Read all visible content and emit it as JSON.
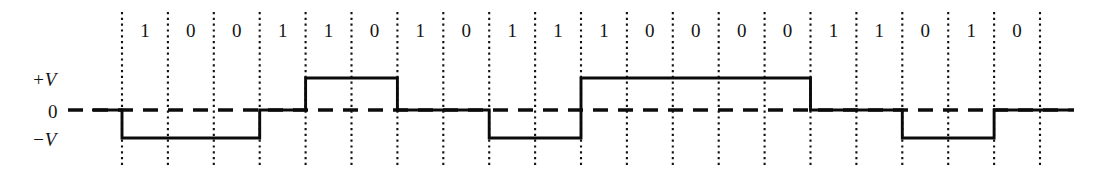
{
  "figure": {
    "title": "",
    "axis_labels": {
      "plus_v": "+V",
      "zero": "0",
      "minus_v": "−V"
    }
  },
  "chart_data": {
    "type": "line",
    "title": "",
    "xlabel": "",
    "ylabel": "",
    "subtitle": "",
    "grid": true,
    "legend": null,
    "ylim": [
      -1,
      1
    ],
    "ytick_labels": [
      "+V",
      "0",
      "−V"
    ],
    "ytick_values": [
      1,
      0,
      -1
    ],
    "bit_count": 20,
    "categories": [
      "1",
      "0",
      "0",
      "1",
      "1",
      "0",
      "1",
      "0",
      "1",
      "1",
      "1",
      "0",
      "0",
      "0",
      "0",
      "1",
      "1",
      "0",
      "1",
      "0"
    ],
    "bit_sequence": "10011010111000011010",
    "series": [
      {
        "name": "line-code-signal",
        "note": "Signal level per bit cell: 1 = +V, 0 = 0 level, -1 = −V",
        "values": [
          -1,
          -1,
          -1,
          0,
          1,
          1,
          0,
          0,
          -1,
          -1,
          1,
          1,
          1,
          1,
          1,
          0,
          0,
          -1,
          -1,
          0
        ]
      }
    ],
    "lead_in_level": 0,
    "lead_out_level": 0,
    "x_start_px": 122,
    "x_end_px": 1040,
    "annotations": []
  }
}
